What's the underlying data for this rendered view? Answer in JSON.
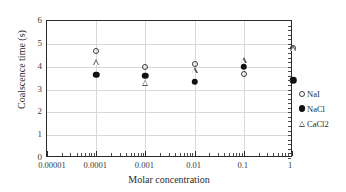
{
  "chart_data": {
    "type": "scatter",
    "title": "",
    "xlabel": "Molar concentration",
    "ylabel": "Coalscence time (s)",
    "xscale": "log",
    "xlim": [
      1e-05,
      1
    ],
    "ylim": [
      0,
      6
    ],
    "xticklabels": [
      "0.00001",
      "0.0001",
      "0.001",
      "0.01",
      "0.1",
      "1"
    ],
    "xtickvalues": [
      1e-05,
      0.0001,
      0.001,
      0.01,
      0.1,
      1
    ],
    "yticklabels": [
      "0",
      "1",
      "2",
      "3",
      "4",
      "5",
      "6"
    ],
    "ytickvalues": [
      0,
      1,
      2,
      3,
      4,
      5,
      6
    ],
    "grid": "both",
    "legend_position": "right-outside",
    "series": [
      {
        "name": "NaI",
        "marker": "open-circle",
        "color": "#3a3a3a",
        "x": [
          0.0001,
          0.001,
          0.01,
          0.1,
          1
        ],
        "y": [
          4.7,
          4.0,
          4.1,
          3.7,
          4.8
        ]
      },
      {
        "name": "NaCl",
        "marker": "filled-circle",
        "color": "#111111",
        "x": [
          0.0001,
          0.001,
          0.01,
          0.1,
          1
        ],
        "y": [
          3.65,
          3.6,
          3.35,
          4.0,
          3.4
        ]
      },
      {
        "name": "CaCl2",
        "marker": "open-triangle",
        "color": "#555555",
        "x": [
          0.0001,
          0.001,
          0.01,
          0.1,
          1
        ],
        "y": [
          4.2,
          3.3,
          3.85,
          4.3,
          4.8
        ]
      }
    ]
  },
  "legend": {
    "items": [
      {
        "label": "NaI",
        "marker": "open-circle"
      },
      {
        "label": "NaCl",
        "marker": "filled-circle"
      },
      {
        "label": "CaCl2",
        "marker": "open-triangle"
      }
    ]
  }
}
